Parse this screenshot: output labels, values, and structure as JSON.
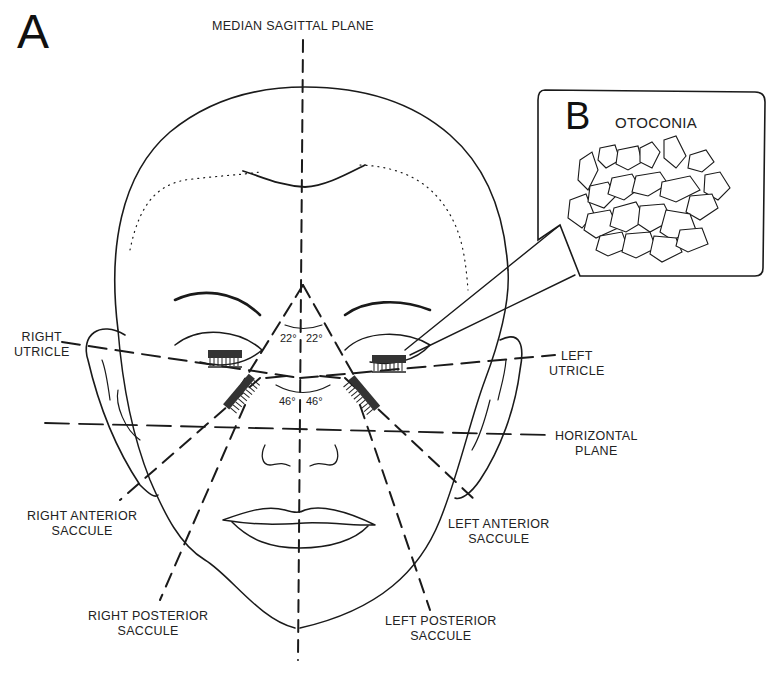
{
  "figure": {
    "panel_a_letter": "A",
    "panel_b_letter": "B",
    "panel_b_title": "OTOCONIA"
  },
  "labels": {
    "median_sagittal_plane": "MEDIAN SAGITTAL PLANE",
    "right_utricle": [
      "RIGHT",
      "UTRICLE"
    ],
    "left_utricle": [
      "LEFT",
      "UTRICLE"
    ],
    "horizontal_plane": [
      "HORIZONTAL",
      "PLANE"
    ],
    "right_anterior_saccule": [
      "RIGHT ANTERIOR",
      "SACCULE"
    ],
    "left_anterior_saccule": [
      "LEFT ANTERIOR",
      "SACCULE"
    ],
    "right_posterior_saccule": [
      "RIGHT POSTERIOR",
      "SACCULE"
    ],
    "left_posterior_saccule": [
      "LEFT POSTERIOR",
      "SACCULE"
    ]
  },
  "angles": {
    "utricle_left": "22°",
    "utricle_right": "22°",
    "saccule_left": "46°",
    "saccule_right": "46°"
  },
  "colors": {
    "ink": "#1a1a1a",
    "background": "#ffffff"
  }
}
